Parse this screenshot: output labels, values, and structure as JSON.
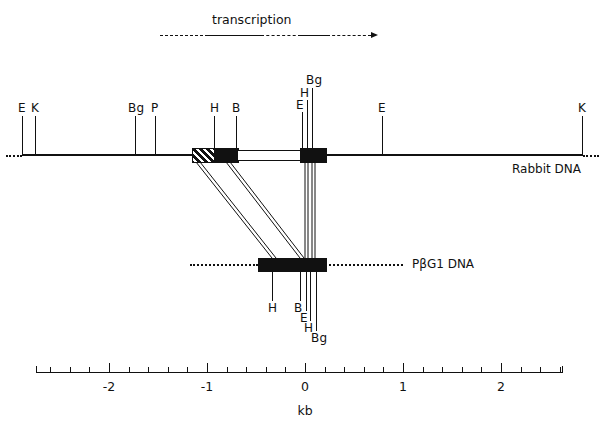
{
  "figure": {
    "type": "restriction-map",
    "transcription": {
      "caption": "transcription",
      "direction": "left-to-right"
    },
    "tracks": [
      {
        "id": "rabbit",
        "name": "Rabbit DNA",
        "sites": [
          {
            "label": "E",
            "kb": -2.86,
            "stem": 40,
            "label_dy": 0
          },
          {
            "label": "K",
            "kb": -2.74,
            "stem": 40,
            "label_dy": 0
          },
          {
            "label": "Bg",
            "kb": -1.73,
            "stem": 40,
            "label_dy": 0
          },
          {
            "label": "P",
            "kb": -1.53,
            "stem": 40,
            "label_dy": 0
          },
          {
            "label": "H",
            "kb": -1.13,
            "stem": 40,
            "label_dy": 0
          },
          {
            "label": "B",
            "kb": -0.79,
            "stem": 40,
            "label_dy": 0
          },
          {
            "label": "E",
            "kb": -0.035,
            "stem": 48,
            "label_dy": 0
          },
          {
            "label": "H",
            "kb": 0.02,
            "stem": 60,
            "label_dy": 0
          },
          {
            "label": "Bg",
            "kb": 0.07,
            "stem": 72,
            "label_dy": 0
          },
          {
            "label": "E",
            "kb": 0.79,
            "stem": 40,
            "label_dy": 0
          },
          {
            "label": "K",
            "kb": 2.64,
            "stem": 40,
            "label_dy": 0
          }
        ]
      },
      {
        "id": "pbg1",
        "name": "PβG1 DNA",
        "sites": [
          {
            "label": "H",
            "kb": -0.44,
            "stem": 36,
            "label_dy": 0
          },
          {
            "label": "B",
            "kb": -0.11,
            "stem": 46,
            "label_dy": 0
          },
          {
            "label": "E",
            "kb": -0.035,
            "stem": 56,
            "label_dy": 0
          },
          {
            "label": "H",
            "kb": 0.02,
            "stem": 66,
            "label_dy": 0
          },
          {
            "label": "Bg",
            "kb": 0.07,
            "stem": 76,
            "label_dy": 0
          }
        ]
      }
    ],
    "axis": {
      "title": "kb",
      "min": -2.75,
      "max": 2.62,
      "major_ticks": [
        -2,
        -1,
        0,
        1,
        2
      ],
      "major_labels": [
        "-2",
        "-1",
        "0",
        "1",
        "2"
      ],
      "minor_step": 0.2
    },
    "colors": {
      "ink": "#111111",
      "paper": "#ffffff"
    }
  }
}
